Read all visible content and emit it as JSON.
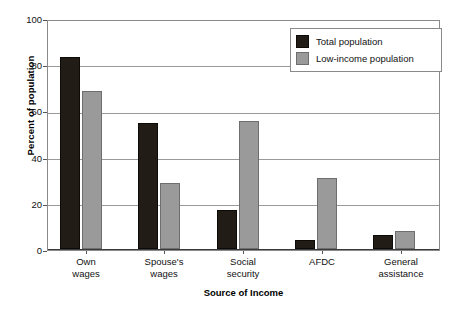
{
  "chart_data": {
    "type": "bar",
    "title": "",
    "xlabel": "Source of Income",
    "ylabel": "Percent of population",
    "categories": [
      "Own\nwages",
      "Spouse's\nwages",
      "Social\nsecurity",
      "AFDC",
      "General\nassistance"
    ],
    "category_lines": [
      [
        "Own",
        "wages"
      ],
      [
        "Spouse's",
        "wages"
      ],
      [
        "Social",
        "security"
      ],
      [
        "AFDC",
        ""
      ],
      [
        "General",
        "assistance"
      ]
    ],
    "series": [
      {
        "name": "Total population",
        "color": "#211c16",
        "values": [
          84,
          55,
          17,
          4,
          6
        ]
      },
      {
        "name": "Low-income population",
        "color": "#9a9a9a",
        "values": [
          69,
          29,
          56,
          31,
          8
        ]
      }
    ],
    "ylim": [
      0,
      100
    ],
    "yticks": [
      0,
      20,
      40,
      60,
      80,
      100
    ],
    "ytick_labels": [
      "0",
      "20",
      "40",
      "60",
      "80",
      "100"
    ],
    "grid": true,
    "grid_axis": "y",
    "legend_position": "top-right"
  },
  "legend": {
    "entries": [
      {
        "label": "Total population",
        "swatch": "total"
      },
      {
        "label": "Low-income population",
        "swatch": "lowincome"
      }
    ]
  }
}
